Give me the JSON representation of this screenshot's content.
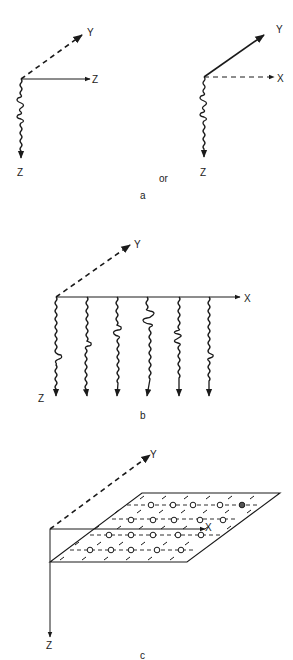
{
  "figure": {
    "panel_a": {
      "caption": "a",
      "connector": "or",
      "left": {
        "axis_right": "Z",
        "axis_diag": "Y",
        "axis_down": "Z"
      },
      "right": {
        "axis_diag": "Y",
        "axis_right": "X",
        "axis_down": "Z"
      }
    },
    "panel_b": {
      "caption": "b",
      "axis_right": "X",
      "axis_diag": "Y",
      "axis_down": "Z",
      "trace_count": 6
    },
    "panel_c": {
      "caption": "c",
      "axis_right": "X",
      "axis_diag": "Y",
      "axis_down": "Z"
    }
  },
  "colors": {
    "ink": "#1a1a1a",
    "background": "#ffffff"
  }
}
